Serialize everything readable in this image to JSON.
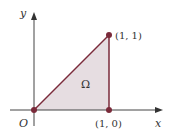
{
  "figure": {
    "axes": {
      "x_label": "x",
      "y_label": "y",
      "origin_label": "O"
    },
    "region": {
      "label": "Ω",
      "vertices": [
        [
          0,
          0
        ],
        [
          1,
          0
        ],
        [
          1,
          1
        ]
      ],
      "fill": "#e6dde1",
      "edge_color": "#7a2a3a"
    },
    "points": [
      {
        "id": "origin",
        "coord": [
          0,
          0
        ],
        "label": ""
      },
      {
        "id": "p10",
        "coord": [
          1,
          0
        ],
        "label": "(1, 0)"
      },
      {
        "id": "p11",
        "coord": [
          1,
          1
        ],
        "label": "(1, 1)"
      }
    ],
    "colors": {
      "axis": "#333333",
      "point": "#7a2a3a"
    }
  }
}
